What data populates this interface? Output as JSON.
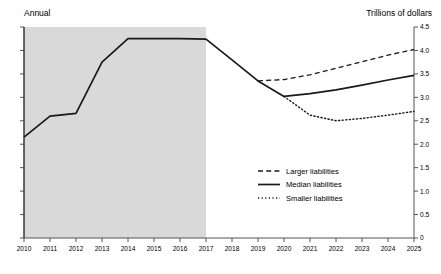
{
  "header": {
    "left_label": "Annual",
    "right_label": "Trillions of dollars"
  },
  "chart_data": {
    "type": "line",
    "title": "",
    "subtitle": "",
    "xlabel": "",
    "ylabel": "Trillions of dollars",
    "frequency_label": "Annual",
    "xlim": [
      2010,
      2025
    ],
    "ylim": [
      0,
      4.5
    ],
    "ytick_labels": [
      "0",
      "0.5",
      "1.0",
      "1.5",
      "2.0",
      "2.5",
      "3.0",
      "3.5",
      "4.0",
      "4.5"
    ],
    "ytick_values": [
      0,
      0.5,
      1.0,
      1.5,
      2.0,
      2.5,
      3.0,
      3.5,
      4.0,
      4.5
    ],
    "xtick_labels": [
      "2010",
      "2011",
      "2012",
      "2013",
      "2014",
      "2015",
      "2016",
      "2017",
      "2018",
      "2019",
      "2020",
      "2021",
      "2022",
      "2023",
      "2024",
      "2025"
    ],
    "x": [
      2010,
      2011,
      2012,
      2013,
      2014,
      2015,
      2016,
      2017,
      2018,
      2019,
      2020,
      2021,
      2022,
      2023,
      2024,
      2025
    ],
    "grid": false,
    "legend_position": "center-right",
    "shaded_region": {
      "label": "historical",
      "x_start": 2010,
      "x_end": 2017,
      "color": "#d9d9d9"
    },
    "series": [
      {
        "name": "Larger liabilities",
        "style": "dashed",
        "color": "#1a1a1a",
        "x": [
          2019,
          2020,
          2021,
          2022,
          2023,
          2024,
          2025
        ],
        "values": [
          3.35,
          3.38,
          3.48,
          3.62,
          3.76,
          3.9,
          4.02
        ]
      },
      {
        "name": "Median liabilities",
        "style": "solid",
        "color": "#1a1a1a",
        "x": [
          2010,
          2011,
          2012,
          2013,
          2014,
          2015,
          2016,
          2017,
          2018,
          2019,
          2020,
          2021,
          2022,
          2023,
          2024,
          2025
        ],
        "values": [
          2.15,
          2.6,
          2.66,
          3.75,
          4.25,
          4.25,
          4.25,
          4.24,
          3.8,
          3.35,
          3.02,
          3.08,
          3.16,
          3.26,
          3.37,
          3.47
        ]
      },
      {
        "name": "Smaller liabilities",
        "style": "dotted",
        "color": "#1a1a1a",
        "x": [
          2020,
          2021,
          2022,
          2023,
          2024,
          2025
        ],
        "values": [
          3.02,
          2.62,
          2.5,
          2.55,
          2.62,
          2.7
        ]
      }
    ],
    "legend": [
      {
        "label": "Larger liabilities",
        "style": "dashed"
      },
      {
        "label": "Median liabilities",
        "style": "solid"
      },
      {
        "label": "Smaller liabilities",
        "style": "dotted"
      }
    ]
  }
}
